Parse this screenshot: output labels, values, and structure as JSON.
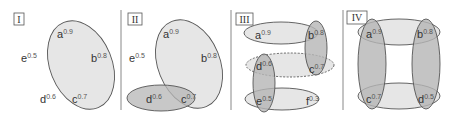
{
  "colors": {
    "light_fill": "#e6e6e6",
    "dark_fill": "#b5b5b5",
    "stroke": "#555555",
    "divider": "#888888"
  },
  "panels": [
    {
      "id": "I",
      "label": "I",
      "vertices": [
        {
          "name": "a",
          "weight": "0.9"
        },
        {
          "name": "b",
          "weight": "0.8"
        },
        {
          "name": "c",
          "weight": "0.7"
        },
        {
          "name": "d",
          "weight": "0.6"
        },
        {
          "name": "e",
          "weight": "0.5"
        }
      ],
      "hyperedges": [
        {
          "members": [
            "a",
            "b",
            "c"
          ],
          "shade": "light"
        }
      ]
    },
    {
      "id": "II",
      "label": "II",
      "vertices": [
        {
          "name": "a",
          "weight": "0.9"
        },
        {
          "name": "b",
          "weight": "0.8"
        },
        {
          "name": "c",
          "weight": "0.7"
        },
        {
          "name": "d",
          "weight": "0.6"
        },
        {
          "name": "e",
          "weight": "0.5"
        }
      ],
      "hyperedges": [
        {
          "members": [
            "a",
            "b",
            "c"
          ],
          "shade": "light"
        },
        {
          "members": [
            "c",
            "d"
          ],
          "shade": "dark"
        }
      ]
    },
    {
      "id": "III",
      "label": "III",
      "vertices": [
        {
          "name": "a",
          "weight": "0.9"
        },
        {
          "name": "b",
          "weight": "0.8"
        },
        {
          "name": "c",
          "weight": "0.7"
        },
        {
          "name": "d",
          "weight": "0.6"
        },
        {
          "name": "e",
          "weight": "0.5"
        },
        {
          "name": "f",
          "weight": "0.3"
        }
      ],
      "hyperedges": [
        {
          "members": [
            "a",
            "b"
          ],
          "shade": "light"
        },
        {
          "members": [
            "b",
            "c"
          ],
          "shade": "dark"
        },
        {
          "members": [
            "d",
            "c"
          ],
          "shade": "light",
          "style": "dashed"
        },
        {
          "members": [
            "d",
            "e"
          ],
          "shade": "dark"
        },
        {
          "members": [
            "e",
            "f"
          ],
          "shade": "light"
        }
      ]
    },
    {
      "id": "IV",
      "label": "IV",
      "vertices": [
        {
          "name": "a",
          "weight": "0.9"
        },
        {
          "name": "b",
          "weight": "0.8"
        },
        {
          "name": "c",
          "weight": "0.7"
        },
        {
          "name": "d",
          "weight": "0.5"
        }
      ],
      "hyperedges": [
        {
          "members": [
            "a",
            "b"
          ],
          "shade": "light"
        },
        {
          "members": [
            "a",
            "c"
          ],
          "shade": "dark"
        },
        {
          "members": [
            "b",
            "d"
          ],
          "shade": "dark"
        },
        {
          "members": [
            "c",
            "d"
          ],
          "shade": "light"
        }
      ]
    }
  ]
}
